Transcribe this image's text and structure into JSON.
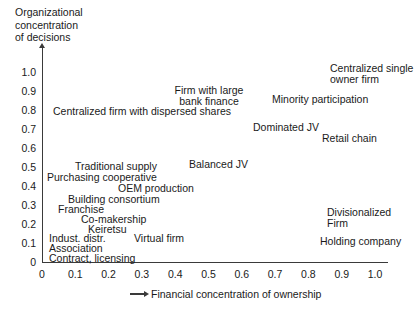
{
  "chart_data": {
    "type": "scatter",
    "title": "",
    "xlabel": "Financial concentration of ownership",
    "ylabel": "Organizational concentration of decisions",
    "ylabel_lines": [
      "Organizational",
      "concentration",
      "of decisions"
    ],
    "xlim": [
      0,
      1.0
    ],
    "ylim": [
      0,
      1.0
    ],
    "grid": false,
    "legend": null,
    "xticks": [
      "0",
      "0.1",
      "0.2",
      "0.3",
      "0.4",
      "0.5",
      "0.6",
      "0.7",
      "0.8",
      "0.9",
      "1.0"
    ],
    "xtick_values": [
      0,
      0.1,
      0.2,
      0.3,
      0.4,
      0.5,
      0.6,
      0.7,
      0.8,
      0.9,
      1.0
    ],
    "yticks": [
      "0",
      "0.1",
      "0.2",
      "0.3",
      "0.4",
      "0.5",
      "0.6",
      "0.7",
      "0.8",
      "0.9",
      "1.0"
    ],
    "ytick_values": [
      0,
      0.1,
      0.2,
      0.3,
      0.4,
      0.5,
      0.6,
      0.7,
      0.8,
      0.9,
      1.0
    ],
    "annotations": [
      {
        "label": "Centralized single\nowner firm",
        "x": 0.87,
        "y": 1.0
      },
      {
        "label": "Firm with large\nbank finance",
        "x": 0.38,
        "y": 0.9
      },
      {
        "label": "Minority participation",
        "x": 0.69,
        "y": 0.87
      },
      {
        "label": "Centralized firm with dispersed shares",
        "x": 0.04,
        "y": 0.8
      },
      {
        "label": "Dominated JV",
        "x": 0.63,
        "y": 0.71
      },
      {
        "label": "Retail chain",
        "x": 0.84,
        "y": 0.66
      },
      {
        "label": "Balanced JV",
        "x": 0.44,
        "y": 0.51
      },
      {
        "label": "Traditional supply",
        "x": 0.1,
        "y": 0.5
      },
      {
        "label": "Purchasing cooperative",
        "x": 0.015,
        "y": 0.44
      },
      {
        "label": "OEM production",
        "x": 0.23,
        "y": 0.39
      },
      {
        "label": "Building consortium",
        "x": 0.08,
        "y": 0.34
      },
      {
        "label": "Franchise",
        "x": 0.05,
        "y": 0.29
      },
      {
        "label": "Co-makership",
        "x": 0.12,
        "y": 0.24
      },
      {
        "label": "Keiretsu",
        "x": 0.14,
        "y": 0.19
      },
      {
        "label": "Indust. distr.",
        "x": 0.02,
        "y": 0.14
      },
      {
        "label": "Virtual firm",
        "x": 0.28,
        "y": 0.14
      },
      {
        "label": "Divisionalized\nFirm",
        "x": 0.86,
        "y": 0.27
      },
      {
        "label": "Holding company",
        "x": 0.84,
        "y": 0.12
      },
      {
        "label": "Association",
        "x": 0.02,
        "y": 0.09
      },
      {
        "label": "Contract, licensing",
        "x": 0.02,
        "y": 0.04
      }
    ]
  },
  "labels": {
    "ytitle_l1": "Organizational",
    "ytitle_l2": "concentration",
    "ytitle_l3": "of decisions",
    "xtitle": "Financial concentration of ownership",
    "points": [
      {
        "l1": "Centralized single",
        "l2": "owner firm",
        "left": 330,
        "top": 63
      },
      {
        "l1": "Firm with large",
        "l2": "bank finance",
        "left": 167,
        "top": 85,
        "align": "center",
        "width": 84
      },
      {
        "l1": "Minority participation",
        "l2": "",
        "left": 272,
        "top": 94
      },
      {
        "l1": "Centralized firm with dispersed shares",
        "l2": "",
        "left": 53,
        "top": 106
      },
      {
        "l1": "Dominated JV",
        "l2": "",
        "left": 253,
        "top": 122
      },
      {
        "l1": "Retail chain",
        "l2": "",
        "left": 322,
        "top": 133
      },
      {
        "l1": "Balanced JV",
        "l2": "",
        "left": 189,
        "top": 159
      },
      {
        "l1": "Traditional supply",
        "l2": "",
        "left": 75,
        "top": 161
      },
      {
        "l1": "Purchasing cooperative",
        "l2": "",
        "left": 47,
        "top": 172
      },
      {
        "l1": "OEM production",
        "l2": "",
        "left": 118,
        "top": 183
      },
      {
        "l1": "Divisionalized",
        "l2": "Firm",
        "left": 327,
        "top": 207
      },
      {
        "l1": "Building consortium",
        "l2": "",
        "left": 68,
        "top": 194
      },
      {
        "l1": "Franchise",
        "l2": "",
        "left": 58,
        "top": 204
      },
      {
        "l1": "Co-makership",
        "l2": "",
        "left": 81,
        "top": 214
      },
      {
        "l1": "Keiretsu",
        "l2": "",
        "left": 88,
        "top": 224
      },
      {
        "l1": "Indust. distr.",
        "l2": "",
        "left": 49,
        "top": 233
      },
      {
        "l1": "Virtual firm",
        "l2": "",
        "left": 134,
        "top": 233
      },
      {
        "l1": "Holding company",
        "l2": "",
        "left": 320,
        "top": 236
      },
      {
        "l1": "Association",
        "l2": "",
        "left": 49,
        "top": 243
      },
      {
        "l1": "Contract, licensing",
        "l2": "",
        "left": 49,
        "top": 253
      }
    ]
  },
  "colors": {
    "background": "#ffffff",
    "axis": "#3a3a3a",
    "text": "#1a1a1a"
  }
}
